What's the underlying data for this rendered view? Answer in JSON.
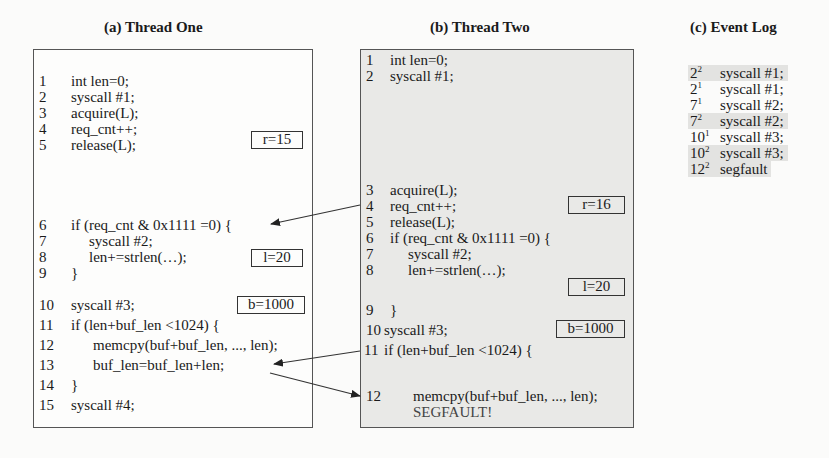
{
  "titles": {
    "thread_one": "(a) Thread One",
    "thread_two": "(b) Thread Two",
    "event_log": "(c) Event Log"
  },
  "thread_one": {
    "lines": [
      {
        "n": "1",
        "code": "int len=0;"
      },
      {
        "n": "2",
        "code": "syscall #1;"
      },
      {
        "n": "3",
        "code": "acquire(L);"
      },
      {
        "n": "4",
        "code": "req_cnt++;"
      },
      {
        "n": "5",
        "code": "release(L);"
      },
      {
        "n": "6",
        "code": "if (req_cnt & 0x1111 =0) {"
      },
      {
        "n": "7",
        "code": "syscall #2;"
      },
      {
        "n": "8",
        "code": "len+=strlen(…);"
      },
      {
        "n": "9",
        "code": "}"
      },
      {
        "n": "10",
        "code": "syscall #3;"
      },
      {
        "n": "11",
        "code": "if (len+buf_len <1024) {"
      },
      {
        "n": "12",
        "code": "memcpy(buf+buf_len, ..., len);"
      },
      {
        "n": "13",
        "code": "buf_len=buf_len+len;"
      },
      {
        "n": "14",
        "code": "}"
      },
      {
        "n": "15",
        "code": "syscall #4;"
      }
    ],
    "tags": {
      "r": "r=15",
      "l": "l=20",
      "b": "b=1000"
    }
  },
  "thread_two": {
    "lines": [
      {
        "n": "1",
        "code": "int len=0;"
      },
      {
        "n": "2",
        "code": "syscall #1;"
      },
      {
        "n": "3",
        "code": "acquire(L);"
      },
      {
        "n": "4",
        "code": "req_cnt++;"
      },
      {
        "n": "5",
        "code": "release(L);"
      },
      {
        "n": "6",
        "code": "if (req_cnt & 0x1111 =0) {"
      },
      {
        "n": "7",
        "code": "syscall #2;"
      },
      {
        "n": "8",
        "code": "len+=strlen(…);"
      },
      {
        "n": "9",
        "code": "}"
      },
      {
        "n": "10",
        "code": "syscall #3;"
      },
      {
        "n": "11",
        "code": "if (len+buf_len <1024) {"
      },
      {
        "n": "12",
        "code": "memcpy(buf+buf_len, ..., len);"
      }
    ],
    "segfault": "SEGFAULT!",
    "tags": {
      "r": "r=16",
      "l": "l=20",
      "b": "b=1000"
    }
  },
  "event_log": [
    {
      "line": "2",
      "thread": "2",
      "event": "syscall #1;",
      "highlight": true
    },
    {
      "line": "2",
      "thread": "1",
      "event": "syscall #1;",
      "highlight": false
    },
    {
      "line": "7",
      "thread": "1",
      "event": "syscall #2;",
      "highlight": false
    },
    {
      "line": "7",
      "thread": "2",
      "event": "syscall #2;",
      "highlight": true
    },
    {
      "line": "10",
      "thread": "1",
      "event": "syscall #3;",
      "highlight": false
    },
    {
      "line": "10",
      "thread": "2",
      "event": "syscall #3;",
      "highlight": true
    },
    {
      "line": "12",
      "thread": "2",
      "event": "segfault",
      "highlight": true
    }
  ],
  "colors": {
    "thread_two_bg": "#e9e9e7",
    "log_highlight": "#e3e3e1",
    "border": "#555555"
  }
}
